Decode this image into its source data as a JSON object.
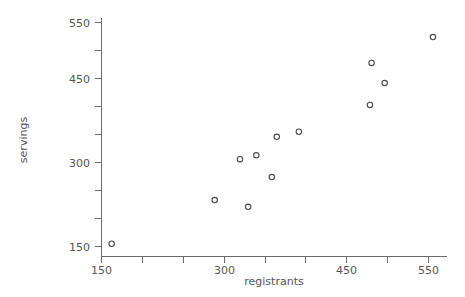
{
  "chart_data": {
    "type": "scatter",
    "title": "",
    "xlabel": "registrants",
    "ylabel": "servings",
    "xlim": [
      140,
      575
    ],
    "ylim": [
      135,
      570
    ],
    "grid": false,
    "legend": null,
    "marker": "open-circle",
    "marker_color": "#4a4a4a",
    "xticks": [
      150,
      200,
      250,
      300,
      350,
      400,
      450,
      500,
      550
    ],
    "xticklabels": [
      "150",
      "",
      "",
      "300",
      "",
      "",
      "450",
      "",
      "550"
    ],
    "yticks": [
      150,
      200,
      250,
      300,
      350,
      400,
      450,
      500,
      550
    ],
    "yticklabels": [
      "150",
      "",
      "",
      "300",
      "",
      "",
      "450",
      "",
      "550"
    ],
    "points": [
      {
        "x": 163,
        "y": 154
      },
      {
        "x": 289,
        "y": 232
      },
      {
        "x": 330,
        "y": 220
      },
      {
        "x": 320,
        "y": 305
      },
      {
        "x": 340,
        "y": 312
      },
      {
        "x": 359,
        "y": 273
      },
      {
        "x": 365,
        "y": 345
      },
      {
        "x": 392,
        "y": 354
      },
      {
        "x": 479,
        "y": 402
      },
      {
        "x": 481,
        "y": 477
      },
      {
        "x": 497,
        "y": 441
      },
      {
        "x": 556,
        "y": 523
      }
    ]
  },
  "axes": {
    "x_title": "registrants",
    "y_title": "servings",
    "x_tick_labels": [
      "150",
      "300",
      "450",
      "550"
    ],
    "y_tick_labels": [
      "550",
      "450",
      "300",
      "150"
    ]
  }
}
